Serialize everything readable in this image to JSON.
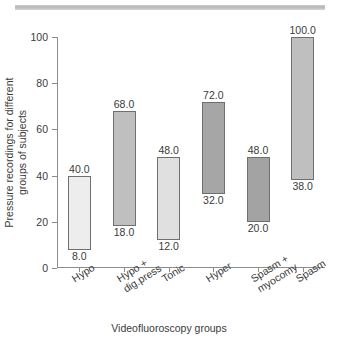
{
  "chart_data": {
    "type": "bar",
    "bar_style": "floating-range",
    "title": "",
    "xlabel": "Videofluoroscopy groups",
    "ylabel": "Pressure recordings for different groups of subjects",
    "ylabel_lines": [
      "Pressure recordings for different",
      "groups of subjects"
    ],
    "categories": [
      "Hypo",
      "Hypo +\ndig.press",
      "Tonic",
      "Hyper",
      "Spasm +\nmyocomy",
      "Spasm"
    ],
    "category_labels_flat": [
      "Hypo",
      "Hypo + dig.press",
      "Tonic",
      "Hyper",
      "Spasm + myocomy",
      "Spasm"
    ],
    "series": [
      {
        "name": "low",
        "values": [
          8.0,
          18.0,
          12.0,
          32.0,
          20.0,
          38.0
        ]
      },
      {
        "name": "high",
        "values": [
          40.0,
          68.0,
          48.0,
          72.0,
          48.0,
          100.0
        ]
      }
    ],
    "bars": [
      {
        "category": "Hypo",
        "low": 8.0,
        "high": 40.0,
        "low_label": "8.0",
        "high_label": "40.0",
        "color": "#ededed"
      },
      {
        "category": "Hypo + dig.press",
        "low": 18.0,
        "high": 68.0,
        "low_label": "18.0",
        "high_label": "68.0",
        "color": "#bfbfbf"
      },
      {
        "category": "Tonic",
        "low": 12.0,
        "high": 48.0,
        "low_label": "12.0",
        "high_label": "48.0",
        "color": "#e0e0e0"
      },
      {
        "category": "Hyper",
        "low": 32.0,
        "high": 72.0,
        "low_label": "32.0",
        "high_label": "72.0",
        "color": "#a6a6a6"
      },
      {
        "category": "Spasm + myocomy",
        "low": 20.0,
        "high": 48.0,
        "low_label": "20.0",
        "high_label": "48.0",
        "color": "#a3a3a3"
      },
      {
        "category": "Spasm",
        "low": 38.0,
        "high": 100.0,
        "low_label": "38.0",
        "high_label": "100.0",
        "color": "#bfbfbf"
      }
    ],
    "ylim": [
      0,
      100
    ],
    "yticks": [
      0,
      20,
      40,
      60,
      80,
      100
    ],
    "ytick_labels": [
      "0",
      "20",
      "40",
      "60",
      "80",
      "100"
    ],
    "grid": false,
    "legend": "none",
    "axis_color": "#8c8c8c",
    "bar_edge_color": "#6f6f6f",
    "text_color": "#3a3a3a"
  },
  "decor": {
    "page_rule_color": "#bdbdbd"
  }
}
